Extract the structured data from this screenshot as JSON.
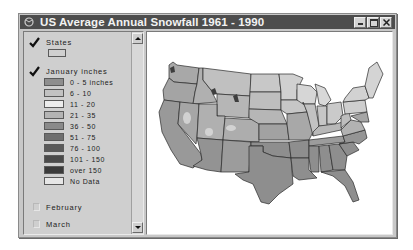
{
  "window": {
    "title": "US Average Annual Snowfall 1961 - 1990",
    "icon": "globe-icon",
    "buttons": [
      "minimize",
      "maximize",
      "close"
    ]
  },
  "legend": {
    "layers": [
      {
        "name": "States",
        "checked": true,
        "symbol": {
          "fill": "#d0d0d0"
        }
      },
      {
        "name": "January inches",
        "checked": true,
        "classes": [
          {
            "label": "0 - 5 inches",
            "color": "#8e8e8e"
          },
          {
            "label": "6 - 10",
            "color": "#c2c2c2"
          },
          {
            "label": "11 - 20",
            "color": "#ececec"
          },
          {
            "label": "21 - 35",
            "color": "#b4b4b4"
          },
          {
            "label": "36 - 50",
            "color": "#8a8a8a"
          },
          {
            "label": "51 - 75",
            "color": "#6e6e6e"
          },
          {
            "label": "76 - 100",
            "color": "#5a5a5a"
          },
          {
            "label": "101 - 150",
            "color": "#4a4a4a"
          },
          {
            "label": "over 150",
            "color": "#3a3a3a"
          },
          {
            "label": "No Data",
            "color": "#e6e6e6"
          }
        ]
      },
      {
        "name": "February",
        "checked": false
      },
      {
        "name": "March",
        "checked": false
      }
    ]
  },
  "map": {
    "title": "Continental United States snowfall map",
    "colors": {
      "south": "#8e8e8e",
      "north_light": "#c6c6c6",
      "north_lighter": "#d6d6d6",
      "mountain": "#a8a8a8",
      "border": "#2a2a2a"
    }
  }
}
